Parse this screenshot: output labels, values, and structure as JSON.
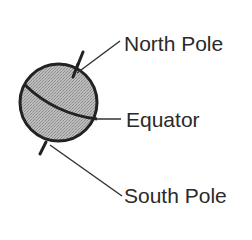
{
  "diagram": {
    "fill_color": "#b3b3b3",
    "stroke_color": "#222222",
    "labels": [
      {
        "id": "north",
        "text": "North Pole"
      },
      {
        "id": "equator",
        "text": "Equator"
      },
      {
        "id": "south",
        "text": "South Pole"
      }
    ]
  }
}
